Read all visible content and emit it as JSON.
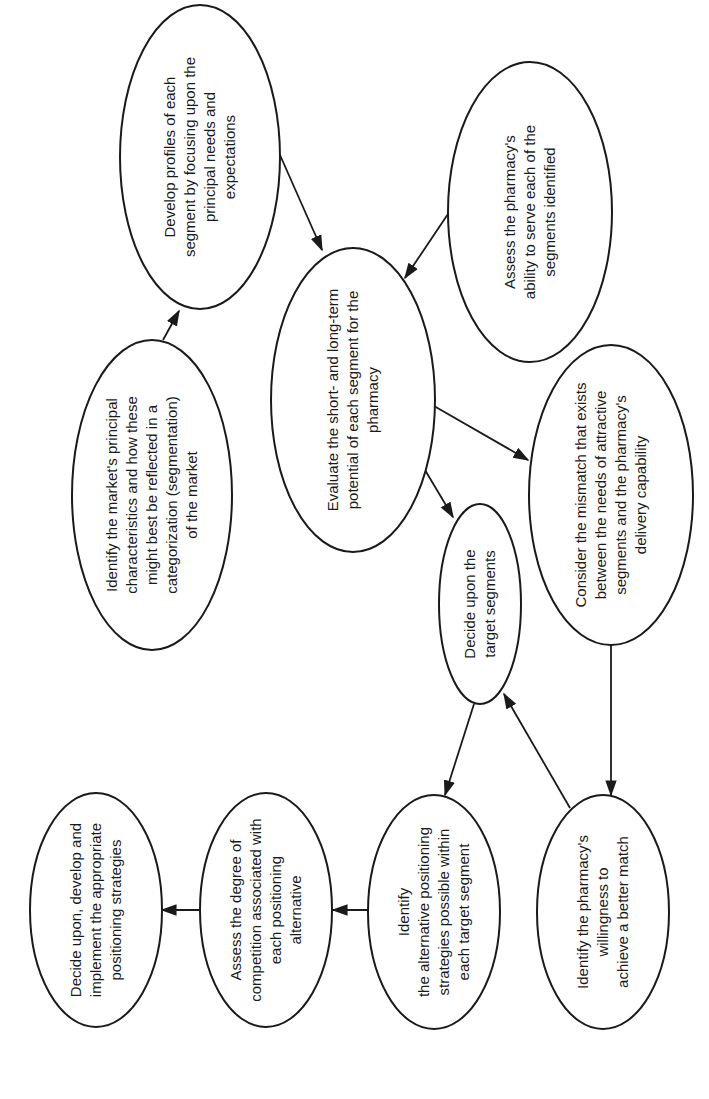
{
  "diagram": {
    "type": "flowchart",
    "orientation": "rotated -90deg",
    "colors": {
      "stroke": "#1a1a1a",
      "fill": "#ffffff",
      "background": "#ffffff"
    },
    "nodes": [
      {
        "id": "develop_profiles",
        "text": "Develop profiles of each\nsegment by focusing upon the\nprincipal needs and\nexpectations"
      },
      {
        "id": "assess_ability",
        "text": "Assess the pharmacy's\nability to serve each of the\nsegments identified"
      },
      {
        "id": "identify_market",
        "text": "Identify the market's principal\ncharacteristics and how these\nmight best be reflected in a\ncategorization (segmentation)\nof the market"
      },
      {
        "id": "evaluate_potential",
        "text": "Evaluate the short- and long-term\npotential of each segment for the\npharmacy"
      },
      {
        "id": "consider_mismatch",
        "text": "Consider the mismatch that exists\nbetween the needs of attractive\nsegments and the pharmacy's\ndelivery capability"
      },
      {
        "id": "decide_target",
        "text": "Decide upon the\ntarget segments"
      },
      {
        "id": "identify_alternatives",
        "text": "Identify\nthe alternative positioning\nstrategies possible within\neach target segment"
      },
      {
        "id": "identify_willingness",
        "text": "Identify the pharmacy's\nwillingness to\nachieve a better match"
      },
      {
        "id": "assess_competition",
        "text": "Assess the degree of\ncompetition associated with\neach positioning\nalternative"
      },
      {
        "id": "decide_implement",
        "text": "Decide upon, develop and\nimplement the appropriate\npositioning strategies"
      }
    ],
    "edges": [
      {
        "from": "identify_market",
        "to": "develop_profiles"
      },
      {
        "from": "develop_profiles",
        "to": "evaluate_potential"
      },
      {
        "from": "assess_ability",
        "to": "evaluate_potential"
      },
      {
        "from": "evaluate_potential",
        "to": "consider_mismatch"
      },
      {
        "from": "evaluate_potential",
        "to": "decide_target"
      },
      {
        "from": "consider_mismatch",
        "to": "identify_willingness"
      },
      {
        "from": "identify_willingness",
        "to": "decide_target"
      },
      {
        "from": "decide_target",
        "to": "identify_alternatives"
      },
      {
        "from": "identify_alternatives",
        "to": "assess_competition"
      },
      {
        "from": "assess_competition",
        "to": "decide_implement"
      }
    ]
  }
}
